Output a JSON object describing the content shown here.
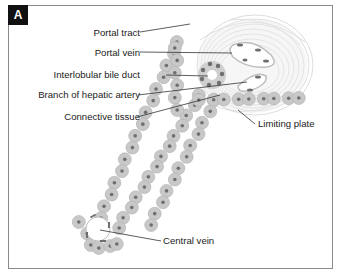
{
  "panel": {
    "label": "A"
  },
  "labels": {
    "portal_tract": "Portal tract",
    "portal_vein": "Portal vein",
    "interlobular_bile_duct": "Interlobular bile duct",
    "branch_hepatic_artery": "Branch of hepatic artery",
    "connective_tissue": "Connective tissue",
    "limiting_plate": "Limiting plate",
    "central_vein": "Central vein"
  },
  "colors": {
    "hepatocyte": "#c8c8c8",
    "hepatocyte_edge": "#b0b0b0",
    "nucleus": "#6e6e6e",
    "connective": "#d8d8d8",
    "leader_line": "#333333",
    "frame": "#8a8a8a",
    "label_box": "#111111"
  }
}
